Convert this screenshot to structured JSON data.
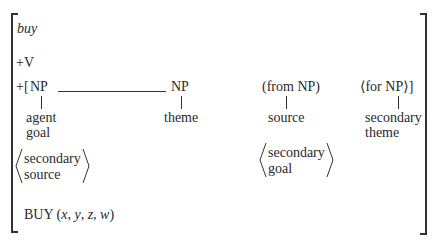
{
  "entry": {
    "word": "buy",
    "category": "+V",
    "frame_prefix": "+[",
    "arguments": [
      {
        "phrase": "NP",
        "roles": [
          "agent",
          "goal"
        ]
      },
      {
        "phrase": "NP",
        "roles": [
          "theme"
        ]
      },
      {
        "phrase": "(from NP)",
        "roles": [
          "source"
        ]
      },
      {
        "phrase": "⟨for NP⟩]",
        "roles": [
          "secondary",
          "theme"
        ]
      }
    ],
    "secondary_roles": [
      {
        "lines": [
          "secondary",
          "source"
        ]
      },
      {
        "lines": [
          "secondary",
          "goal"
        ]
      }
    ],
    "semantic": {
      "predicate": "BUY",
      "args_text": "(x, y, z, w)",
      "open": "(",
      "vars": [
        "x",
        "y",
        "z",
        "w"
      ],
      "close": ")"
    }
  }
}
